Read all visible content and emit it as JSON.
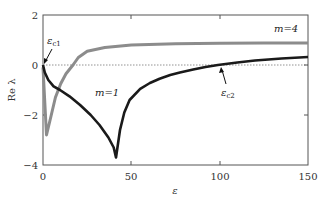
{
  "chart_data": {
    "type": "line",
    "title": "",
    "xlabel": "ε",
    "ylabel": "Re λ",
    "xlim": [
      0,
      150
    ],
    "ylim": [
      -4,
      2
    ],
    "xticks": [
      0,
      50,
      100,
      150
    ],
    "yticks": [
      -4,
      -2,
      0,
      2
    ],
    "grid": false,
    "legend": null,
    "reference_line": {
      "y": 0,
      "style": "dotted"
    },
    "series": [
      {
        "name": "m=1",
        "color": "#1a1a1a",
        "points": [
          [
            0,
            0
          ],
          [
            1,
            -0.3
          ],
          [
            3,
            -0.6
          ],
          [
            6,
            -0.85
          ],
          [
            9.6,
            -1.0
          ],
          [
            15,
            -1.25
          ],
          [
            21,
            -1.6
          ],
          [
            27,
            -2.0
          ],
          [
            32,
            -2.4
          ],
          [
            37,
            -2.9
          ],
          [
            40,
            -3.3
          ],
          [
            41.3,
            -3.7
          ],
          [
            43.6,
            -2.6
          ],
          [
            46,
            -1.9
          ],
          [
            49,
            -1.4
          ],
          [
            55,
            -0.95
          ],
          [
            60.5,
            -0.72
          ],
          [
            66,
            -0.55
          ],
          [
            72,
            -0.4
          ],
          [
            77.5,
            -0.3
          ],
          [
            85,
            -0.18
          ],
          [
            92,
            -0.08
          ],
          [
            99,
            0.0
          ],
          [
            110,
            0.1
          ],
          [
            120,
            0.18
          ],
          [
            135,
            0.26
          ],
          [
            150,
            0.32
          ]
        ]
      },
      {
        "name": "m=4",
        "color": "#8c8c8c",
        "points": [
          [
            0,
            -0.1
          ],
          [
            1,
            -1.5
          ],
          [
            2,
            -2.8
          ],
          [
            4,
            -2.2
          ],
          [
            7,
            -1.3
          ],
          [
            10,
            -0.75
          ],
          [
            13,
            -0.35
          ],
          [
            17,
            0.0
          ],
          [
            20,
            0.3
          ],
          [
            25,
            0.55
          ],
          [
            35,
            0.7
          ],
          [
            50,
            0.8
          ],
          [
            75,
            0.85
          ],
          [
            100,
            0.87
          ],
          [
            125,
            0.88
          ],
          [
            150,
            0.88
          ]
        ]
      }
    ],
    "annotations": [
      {
        "text": "m=1",
        "x": 35,
        "y": -1.1
      },
      {
        "text": "m=4",
        "x": 137,
        "y": 1.45
      },
      {
        "text": "ε_c1",
        "x": 4,
        "y": 1.0,
        "arrow_to": [
          0,
          0
        ]
      },
      {
        "text": "ε_c2",
        "x": 104,
        "y": -1.1,
        "arrow_to": [
          99,
          0
        ]
      }
    ]
  },
  "labels": {
    "xlabel": "ε",
    "ylabel": "Re λ",
    "m1": "m=1",
    "m4": "m=4",
    "ec1_main": "ε",
    "ec1_sub": "c1",
    "ec2_main": "ε",
    "ec2_sub": "c2",
    "xt0": "0",
    "xt50": "50",
    "xt100": "100",
    "xt150": "150",
    "ytm4": "−4",
    "ytm2": "−2",
    "yt0": "0",
    "yt2": "2"
  }
}
